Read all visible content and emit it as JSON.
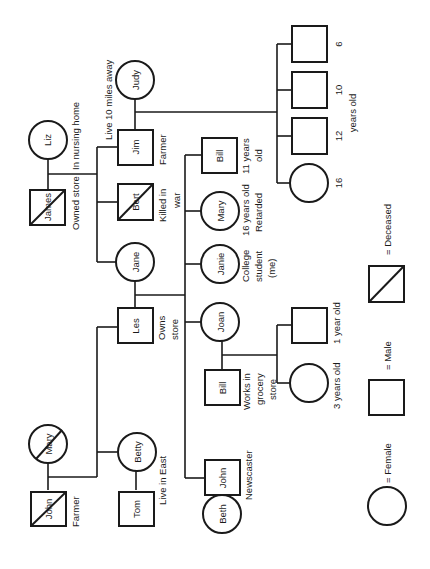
{
  "orientation": "rotated 90deg counter-clockwise",
  "colors": {
    "ink": "#1a1a1a",
    "background": "#ffffff"
  },
  "people": {
    "james": {
      "name": "James",
      "sex": "male",
      "deceased": true,
      "note": "Owned store"
    },
    "liz": {
      "name": "Liz",
      "sex": "female",
      "deceased": false,
      "note": "In nursing home"
    },
    "jim": {
      "name": "Jim",
      "sex": "male",
      "deceased": false,
      "note": "Farmer"
    },
    "judy": {
      "name": "Judy",
      "sex": "female",
      "deceased": false
    },
    "jim_judy_note": "Live 10 miles away",
    "bert": {
      "name": "Bert",
      "sex": "male",
      "deceased": true,
      "note1": "Killed in",
      "note2": "war"
    },
    "jane": {
      "name": "Jane",
      "sex": "female",
      "deceased": false
    },
    "les": {
      "name": "Les",
      "sex": "male",
      "deceased": false,
      "note1": "Owns",
      "note2": "store"
    },
    "bill_young": {
      "name": "Bill",
      "sex": "male",
      "note1": "11 years",
      "note2": "old"
    },
    "mary_daughter": {
      "name": "Mary",
      "sex": "female",
      "note1": "16 years old",
      "note2": "Retarded"
    },
    "janie": {
      "name": "Janie",
      "sex": "female",
      "note1": "College",
      "note2": "student",
      "note3": "(me)"
    },
    "joan": {
      "name": "Joan",
      "sex": "female"
    },
    "bill_grocery": {
      "name": "Bill",
      "sex": "male",
      "note1": "Works in",
      "note2": "grocery",
      "note3": "store"
    },
    "john_son": {
      "name": "John",
      "sex": "male",
      "note": "Newscaster"
    },
    "beth": {
      "name": "Beth",
      "sex": "female"
    },
    "mary_grandmother": {
      "name": "Mary",
      "sex": "female",
      "deceased": true
    },
    "john_grandfather": {
      "name": "John",
      "sex": "male",
      "deceased": true,
      "note": "Farmer"
    },
    "betty": {
      "name": "Betty",
      "sex": "female",
      "note": "Live in East"
    },
    "tom": {
      "name": "Tom",
      "sex": "male"
    }
  },
  "jim_children": {
    "ages": [
      "16",
      "12",
      "10",
      "6"
    ],
    "label": "years old"
  },
  "bill_joan_children": {
    "girl": "3 years old",
    "boy": "1 year old"
  },
  "legend": {
    "female": "= Female",
    "male": "= Male",
    "deceased": "= Deceased"
  }
}
